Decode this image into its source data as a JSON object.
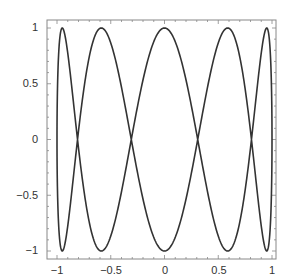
{
  "chart_data": {
    "type": "line",
    "title": "",
    "xlabel": "",
    "ylabel": "",
    "param": {
      "x_freq": 1,
      "y_freq": 5,
      "samples": 800
    },
    "xlim": [
      -1.05,
      1.05
    ],
    "ylim": [
      -1.05,
      1.05
    ],
    "grid": false,
    "legend": null,
    "x_ticks": [
      {
        "value": -1,
        "label": "−1"
      },
      {
        "value": -0.5,
        "label": "−0.5"
      },
      {
        "value": 0,
        "label": "0"
      },
      {
        "value": 0.5,
        "label": "0.5"
      },
      {
        "value": 1,
        "label": "1"
      }
    ],
    "y_ticks": [
      {
        "value": 1,
        "label": "1"
      },
      {
        "value": 0.5,
        "label": "0.5"
      },
      {
        "value": 0,
        "label": "0"
      },
      {
        "value": -0.5,
        "label": "−0.5"
      },
      {
        "value": -1,
        "label": "−1"
      }
    ],
    "series": [
      {
        "name": "lissajous",
        "color": "#333333"
      }
    ]
  },
  "labels": {
    "x0": "−1",
    "x1": "−0.5",
    "x2": "0",
    "x3": "0.5",
    "x4": "1",
    "y0": "1",
    "y1": "0.5",
    "y2": "0",
    "y3": "−0.5",
    "y4": "−1"
  }
}
